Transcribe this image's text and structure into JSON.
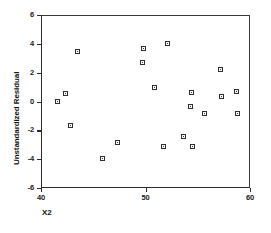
{
  "chart_data": {
    "type": "scatter",
    "title": "",
    "xlabel": "X2",
    "ylabel": "Unstandardized Residual",
    "xlim": [
      40,
      60
    ],
    "ylim": [
      -6,
      6
    ],
    "xticks": [
      40,
      50,
      60
    ],
    "xtick_labels": [
      "40",
      "50",
      "60"
    ],
    "yticks": [
      6,
      4,
      2,
      0,
      -2,
      -4,
      -6
    ],
    "ytick_labels": [
      "6",
      "4",
      "2",
      "0",
      "-2",
      "-4",
      "-6"
    ],
    "grid": false,
    "legend": null,
    "marker": "open-square",
    "marker_color": "#2e2e2e",
    "points": [
      {
        "x": 41.6,
        "y": 0.0
      },
      {
        "x": 42.3,
        "y": 0.55
      },
      {
        "x": 42.8,
        "y": -1.65
      },
      {
        "x": 43.5,
        "y": 3.5
      },
      {
        "x": 45.9,
        "y": -3.95
      },
      {
        "x": 47.3,
        "y": -2.85
      },
      {
        "x": 49.7,
        "y": 2.7
      },
      {
        "x": 49.8,
        "y": 3.7
      },
      {
        "x": 50.9,
        "y": 1.0
      },
      {
        "x": 51.7,
        "y": -3.15
      },
      {
        "x": 52.1,
        "y": 4.05
      },
      {
        "x": 53.6,
        "y": -2.45
      },
      {
        "x": 54.3,
        "y": -0.35
      },
      {
        "x": 54.4,
        "y": 0.65
      },
      {
        "x": 54.5,
        "y": -3.15
      },
      {
        "x": 55.6,
        "y": -0.85
      },
      {
        "x": 57.2,
        "y": 2.25
      },
      {
        "x": 57.3,
        "y": 0.35
      },
      {
        "x": 58.7,
        "y": 0.7
      },
      {
        "x": 58.8,
        "y": -0.8
      }
    ]
  }
}
